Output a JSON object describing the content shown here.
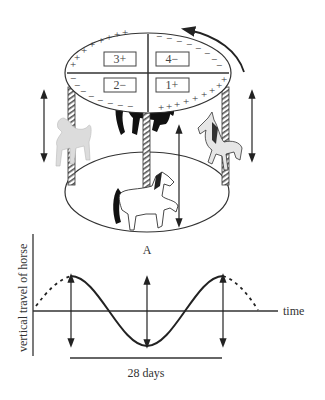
{
  "carousel": {
    "quadrants": [
      {
        "id": "q3",
        "label": "3+"
      },
      {
        "id": "q4",
        "label": "4−"
      },
      {
        "id": "q2",
        "label": "2−"
      },
      {
        "id": "q1",
        "label": "1+"
      }
    ],
    "plus_sign": "+",
    "minus_sign": "−",
    "horse_label": "A",
    "rotation_direction": "counterclockwise"
  },
  "graph": {
    "y_axis_label": "vertical travel of horse",
    "x_axis_label": "time",
    "period_label": "28 days"
  },
  "colors": {
    "line": "#222222",
    "pole_stripe": "#555555",
    "horse_light": "#d8d8d8",
    "horse_dark": "#111111"
  }
}
